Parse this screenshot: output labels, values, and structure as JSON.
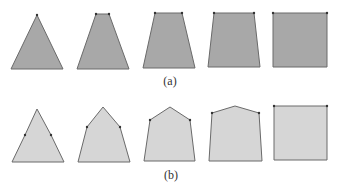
{
  "figure": {
    "rows": [
      {
        "label": "(a)",
        "fill": "#a8a8a8",
        "stroke": "#6a6a6a",
        "shapes": [
          {
            "name": "triangle",
            "points": "37,15 63,69 11,69"
          },
          {
            "name": "trapezoid-narrow-top",
            "points": "96,14 109,14 129,69 77,69"
          },
          {
            "name": "trapezoid-medium-top",
            "points": "155,13 182,13 195,68 143,68"
          },
          {
            "name": "trapezoid-wide-top",
            "points": "214,13 254,13 260,67 208,67"
          },
          {
            "name": "square",
            "points": "273,13 327,13 327,67 273,67"
          }
        ],
        "vertex_dots": [
          [
            37,
            15
          ],
          [
            96,
            14
          ],
          [
            109,
            14
          ],
          [
            155,
            13
          ],
          [
            182,
            13
          ],
          [
            214,
            13
          ],
          [
            254,
            13
          ],
          [
            273,
            13
          ],
          [
            327,
            13
          ]
        ]
      },
      {
        "label": "(b)",
        "fill": "#d6d6d6",
        "stroke": "#6a6a6a",
        "shapes": [
          {
            "name": "triangle",
            "points": "37,109 51,135 64,162 12,162 25,135"
          },
          {
            "name": "pentagon-tall-apex",
            "points": "103,107 120,127 130,162 78,162 87,127"
          },
          {
            "name": "pentagon-medium-apex",
            "points": "170,107 190,120 195,161 144,161 150,120"
          },
          {
            "name": "pentagon-low-apex",
            "points": "235,106 259,113 262,161 209,161 212,113"
          },
          {
            "name": "square",
            "points": "274,106 327,106 327,160 274,160"
          }
        ],
        "vertex_dots": [
          [
            25,
            135
          ],
          [
            51,
            135
          ],
          [
            87,
            127
          ],
          [
            120,
            127
          ],
          [
            150,
            120
          ],
          [
            190,
            120
          ],
          [
            212,
            113
          ],
          [
            259,
            113
          ],
          [
            274,
            106
          ],
          [
            327,
            106
          ]
        ]
      }
    ]
  }
}
